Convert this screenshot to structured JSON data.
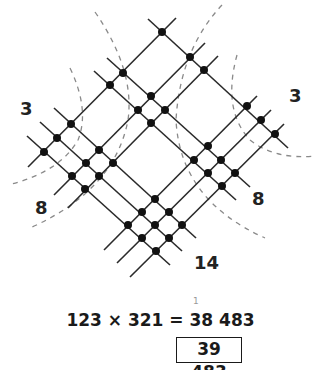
{
  "diagram": {
    "multiplicand": "123",
    "multiplier": "321",
    "group_labels": {
      "left_top": "3",
      "left_bottom": "8",
      "right_top": "3",
      "right_middle": "8",
      "bottom": "14"
    },
    "colors": {
      "lines": "#2a2a2a",
      "dots": "#111111",
      "dashed_arcs": "#8a8a8a",
      "text": "#1a1a1a"
    }
  },
  "equation": {
    "text": "123 × 321 = 38 483",
    "carry": "1",
    "answer": "39 483"
  }
}
